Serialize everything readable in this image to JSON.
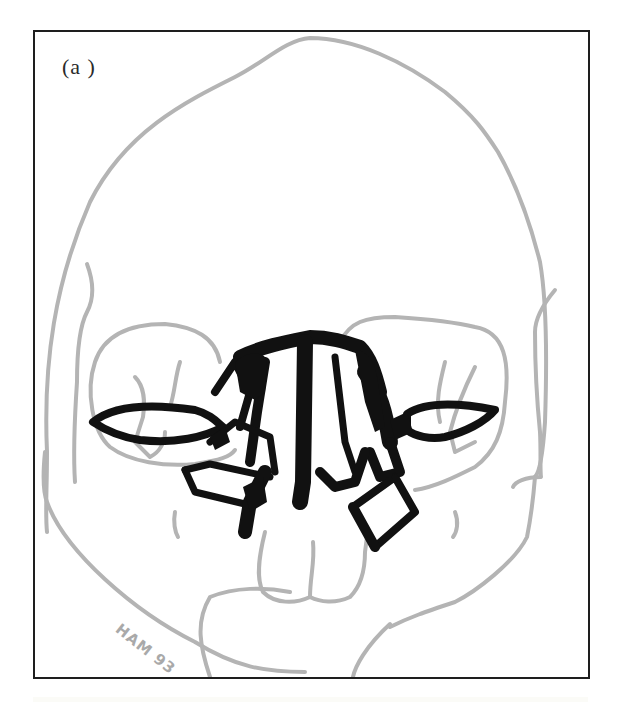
{
  "figure": {
    "panel_label": "(a )",
    "signature": "HAM 93",
    "colors": {
      "frame": "#1e1e1e",
      "skull_outline": "#b4b4b4",
      "plates": "#111111",
      "background": "#ffffff",
      "signature": "#a9a9a9"
    }
  }
}
